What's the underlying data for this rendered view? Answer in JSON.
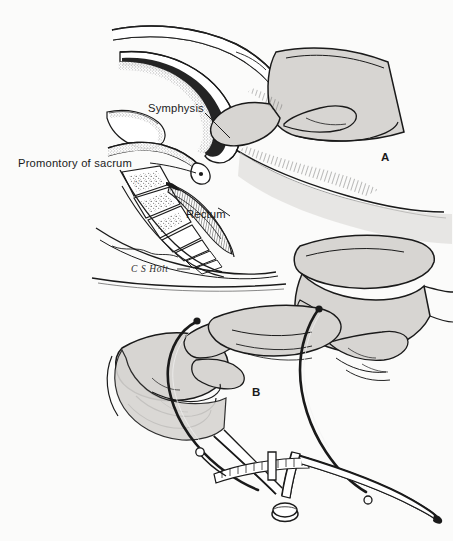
{
  "figure": {
    "type": "medical-illustration",
    "background_color": "#fbfbfa",
    "ink_color": "#1a1a1a",
    "flesh_fill": "#d7d5d2",
    "bone_fill": "#ffffff",
    "shadow_fill": "#b9b7b4"
  },
  "labels": {
    "symphysis": "Symphysis",
    "promontory": "Promontory of sacrum",
    "rectum": "Rectum"
  },
  "panels": [
    {
      "id": "A",
      "label": "A",
      "caption": "Vaginal estimation of the diagonal conjugate"
    },
    {
      "id": "B",
      "label": "B",
      "caption": "Transfer of the measurement to the pelvimeter"
    }
  ],
  "signature": "C S Holt",
  "caption": {
    "text": "",
    "visible": false
  },
  "annotations": {
    "leader_lines": [
      {
        "from": "symphysis",
        "to": "symphysis-pubis-bone"
      },
      {
        "from": "promontory",
        "to": "sacral-promontory"
      },
      {
        "from": "rectum",
        "to": "rectal-wall"
      }
    ]
  }
}
